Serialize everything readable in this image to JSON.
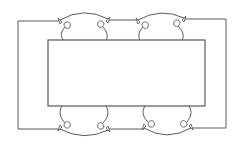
{
  "diagram": {
    "colors": {
      "stroke": "#5a5a5a",
      "box_stroke": "#4a4a4a",
      "background": "#ffffff"
    },
    "outer_frame": {
      "left": 18,
      "top": 20,
      "right": 226,
      "bottom": 129
    },
    "inner_box": {
      "x": 48,
      "y": 40,
      "width": 157,
      "height": 66
    },
    "connectors": [
      {
        "id": "top-left",
        "from_x": 60,
        "to_x": 108,
        "peak_y": 13,
        "side": "top"
      },
      {
        "id": "top-right",
        "from_x": 138,
        "to_x": 184,
        "peak_y": 14,
        "side": "top"
      },
      {
        "id": "bottom-left",
        "from_x": 60,
        "to_x": 108,
        "peak_y": 136,
        "side": "bottom"
      },
      {
        "id": "bottom-right",
        "from_x": 144,
        "to_x": 191,
        "peak_y": 136,
        "side": "bottom"
      }
    ],
    "labels": []
  }
}
